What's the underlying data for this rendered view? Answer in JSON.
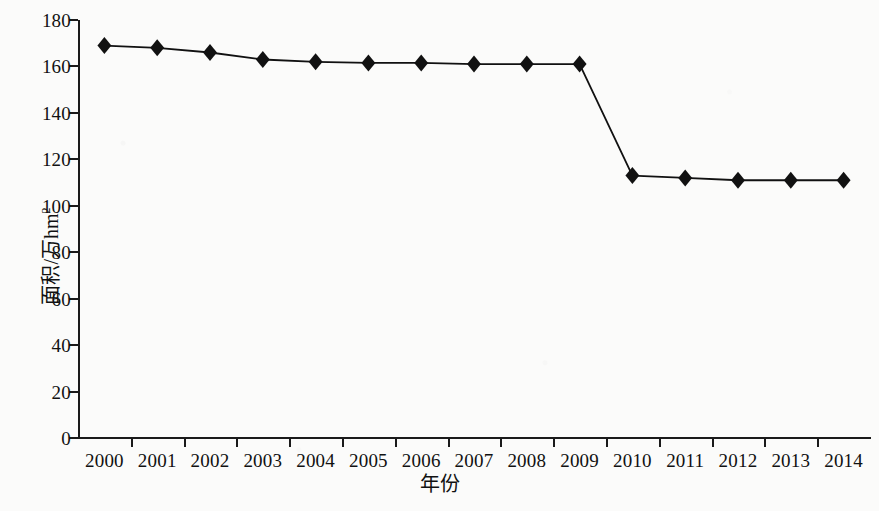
{
  "chart_data": {
    "type": "line",
    "title": "",
    "xlabel": "年份",
    "ylabel": "面积/万hm",
    "ylabel_sup": "2",
    "categories": [
      "2000",
      "2001",
      "2002",
      "2003",
      "2004",
      "2005",
      "2006",
      "2007",
      "2008",
      "2009",
      "2010",
      "2011",
      "2012",
      "2013",
      "2014"
    ],
    "values": [
      169,
      168,
      166,
      163,
      162,
      161.5,
      161.5,
      161,
      161,
      161,
      113,
      112,
      111,
      111,
      111
    ],
    "series": [
      {
        "name": "面积",
        "values": [
          169,
          168,
          166,
          163,
          162,
          161.5,
          161.5,
          161,
          161,
          161,
          113,
          112,
          111,
          111,
          111
        ]
      }
    ],
    "x": [
      "2000",
      "2001",
      "2002",
      "2003",
      "2004",
      "2005",
      "2006",
      "2007",
      "2008",
      "2009",
      "2010",
      "2011",
      "2012",
      "2013",
      "2014"
    ],
    "ylim": [
      0,
      180
    ],
    "yticks": [
      0,
      20,
      40,
      60,
      80,
      100,
      120,
      140,
      160,
      180
    ],
    "ytick_labels": [
      "0",
      "20",
      "40",
      "60",
      "80",
      "100",
      "120",
      "140",
      "160",
      "180"
    ],
    "grid": false,
    "legend": false,
    "legend_position": "none",
    "marker": "diamond",
    "line_color": "#111111",
    "marker_color": "#111111"
  }
}
